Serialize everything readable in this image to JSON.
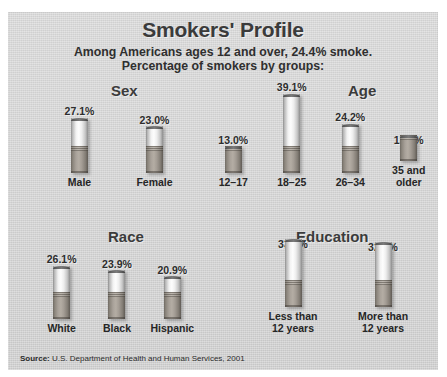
{
  "title": "Smokers' Profile",
  "subtitle_line1": "Among Americans ages 12 and over, 24.4% smoke.",
  "subtitle_line2": "Percentage of smokers by groups:",
  "source_label": "Source:",
  "source_text": "U.S. Department of Health and Human Services, 2001",
  "colors": {
    "panel_background": "#d2d2d2",
    "title_text": "#3b3b3b",
    "body_text": "#2d2d2d",
    "cigarette_paper": "#fdfdfd",
    "cigarette_filter": "#a9a29a",
    "cigarette_cap": "#4c4c4c"
  },
  "groups": [
    {
      "heading": "Sex",
      "bars": [
        {
          "label": "Male",
          "value": 27.1,
          "value_label": "27.1%"
        },
        {
          "label": "Female",
          "value": 23.0,
          "value_label": "23.0%"
        }
      ]
    },
    {
      "heading": "Age",
      "bars": [
        {
          "label": "12–17",
          "value": 13.0,
          "value_label": "13.0%"
        },
        {
          "label": "18–25",
          "value": 39.1,
          "value_label": "39.1%"
        },
        {
          "label": "26–34",
          "value": 24.2,
          "value_label": "24.2%"
        },
        {
          "label": "35 and\nolder",
          "value": 13.1,
          "value_label": "13.1%"
        }
      ]
    },
    {
      "heading": "Race",
      "bars": [
        {
          "label": "White",
          "value": 26.1,
          "value_label": "26.1%"
        },
        {
          "label": "Black",
          "value": 23.9,
          "value_label": "23.9%"
        },
        {
          "label": "Hispanic",
          "value": 20.9,
          "value_label": "20.9%"
        }
      ]
    },
    {
      "heading": "Education",
      "bars": [
        {
          "label": "Less than\n12 years",
          "value": 33.8,
          "value_label": "33.8%"
        },
        {
          "label": "More than\n12 years",
          "value": 32.1,
          "value_label": "32.1%"
        }
      ]
    }
  ],
  "chart_data": {
    "type": "bar",
    "title": "Smokers' Profile",
    "subtitle": "Among Americans ages 12 and over, 24.4% smoke. Percentage of smokers by groups:",
    "xlabel": "",
    "ylabel": "Percentage of smokers",
    "ylim": [
      0,
      40
    ],
    "grid": false,
    "legend": "none",
    "units": "percent",
    "overall_rate": 24.4,
    "panels": [
      {
        "name": "Sex",
        "categories": [
          "Male",
          "Female"
        ],
        "values": [
          27.1,
          23.0
        ]
      },
      {
        "name": "Age",
        "categories": [
          "12–17",
          "18–25",
          "26–34",
          "35 and older"
        ],
        "values": [
          13.0,
          39.1,
          24.2,
          13.1
        ]
      },
      {
        "name": "Race",
        "categories": [
          "White",
          "Black",
          "Hispanic"
        ],
        "values": [
          26.1,
          23.9,
          20.9
        ]
      },
      {
        "name": "Education",
        "categories": [
          "Less than 12 years",
          "More than 12 years"
        ],
        "values": [
          33.8,
          32.1
        ]
      }
    ],
    "source": "U.S. Department of Health and Human Services, 2001"
  }
}
